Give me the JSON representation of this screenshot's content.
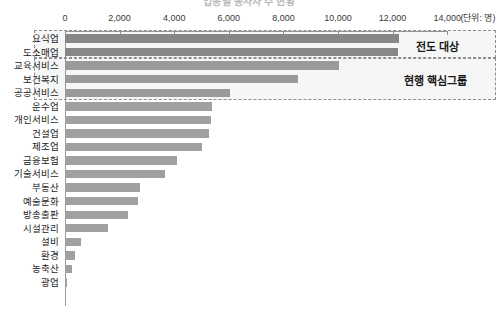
{
  "chart_data": {
    "type": "bar",
    "orientation": "horizontal",
    "title": "업종별 종사자 수 현황",
    "xlabel": "",
    "ylabel": "",
    "unit_note": "(단위: 명)",
    "xlim": [
      0,
      14000
    ],
    "xticks": [
      0,
      2000,
      4000,
      6000,
      8000,
      10000,
      12000,
      14000
    ],
    "xtick_labels": [
      "0",
      "2,000",
      "4,000",
      "6,000",
      "8,000",
      "10,000",
      "12,000",
      "14,000"
    ],
    "grid": false,
    "legend": "none",
    "categories": [
      "요식업",
      "도소매업",
      "교육서비스",
      "보건복지",
      "공공서비스",
      "운수업",
      "개인서비스",
      "건설업",
      "제조업",
      "금융보험",
      "기술서비스",
      "부동산",
      "예술문화",
      "방송출판",
      "시설관리",
      "설비",
      "환경",
      "농축산",
      "광업"
    ],
    "values": [
      12250,
      12180,
      10030,
      8530,
      6060,
      5400,
      5330,
      5290,
      5000,
      4120,
      3680,
      2760,
      2690,
      2320,
      1580,
      590,
      370,
      260,
      80
    ],
    "annotations": [
      {
        "label": "전도 대상",
        "covers": [
          "요식업",
          "도소매업"
        ]
      },
      {
        "label": "현행 핵심그룹",
        "covers": [
          "교육서비스",
          "보건복지",
          "공공서비스"
        ]
      }
    ],
    "colors": {
      "bar": "#a0a0a0",
      "bar_highlight": "#8c8c8c",
      "axis": "#9a9a9a",
      "annotation_border": "#8d8d8d",
      "text": "#1d1d1d"
    }
  }
}
